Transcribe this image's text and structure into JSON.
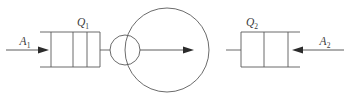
{
  "figure": {
    "name": "two-cylinder-heat-engine-schematic",
    "width": 350,
    "height": 102,
    "background_color": "#ffffff",
    "line_color": "#5a5a5a",
    "label_color": "#3a3a3a"
  },
  "labels": {
    "heat_left": {
      "symbol": "Q",
      "subscript": "1",
      "text": "Q1"
    },
    "heat_right": {
      "symbol": "Q",
      "subscript": "2",
      "text": "Q2"
    },
    "flow_left": {
      "symbol": "A",
      "subscript": "1",
      "text": "A1"
    },
    "flow_right": {
      "symbol": "A",
      "subscript": "2",
      "text": "A2"
    }
  },
  "components": {
    "left_cylinder": {
      "name": "left-piston-cylinder",
      "label": "Q1",
      "divider_count": 2,
      "x": 51,
      "y": 32,
      "width": 49,
      "height": 35
    },
    "right_cylinder": {
      "name": "right-piston-cylinder",
      "label": "Q2",
      "divider_count": 2,
      "x": 241,
      "y": 32,
      "width": 47,
      "height": 35
    },
    "small_circle": {
      "name": "small-circle-node",
      "cx": 125,
      "cy": 50,
      "r": 15
    },
    "large_circle": {
      "name": "large-circle-reservoir",
      "cx": 167,
      "cy": 50,
      "r": 42
    },
    "output_arrow": {
      "name": "output-work-arrow",
      "direction": "right",
      "x1": 140,
      "x2": 190,
      "y": 50
    },
    "left_arrow": {
      "name": "left-inflow-arrow",
      "direction": "right",
      "label": "A1",
      "x1": 6,
      "x2": 45,
      "y": 50
    },
    "right_arrow": {
      "name": "right-inflow-arrow",
      "direction": "left",
      "label": "A2",
      "x1": 344,
      "x2": 296,
      "y": 50
    }
  }
}
